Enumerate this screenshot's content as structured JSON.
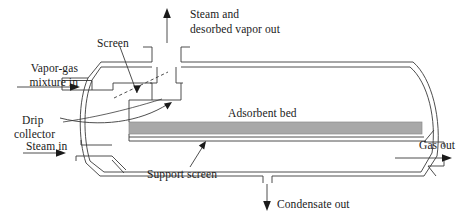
{
  "figure": {
    "type": "process-flow-diagram",
    "canvas": {
      "width": 468,
      "height": 222
    },
    "colors": {
      "line": "#3a3a3a",
      "bed_fill": "#a8a8a8",
      "bed_edge": "#8c8c8c",
      "text": "#1a1a1a",
      "background": "#ffffff"
    }
  },
  "labels": {
    "steam_out": "Steam and\ndesorbed vapor out",
    "steam_out_line1": "Steam and",
    "steam_out_line2": "desorbed vapor out",
    "screen": "Screen",
    "vapor_in_line1": "Vapor-gas",
    "vapor_in_line2": "mixture in",
    "drip_line1": "Drip",
    "drip_line2": "collector",
    "steam_in": "Steam in",
    "adsorbent_bed": "Adsorbent bed",
    "support_screen": "Support screen",
    "condensate_out": "Condensate out",
    "gas_out": "Gas out"
  },
  "flows": [
    {
      "name": "vapor-gas-mixture-in",
      "label": "Vapor-gas mixture in",
      "direction": "right",
      "location": "left-upper"
    },
    {
      "name": "steam-in",
      "label": "Steam in",
      "direction": "right",
      "location": "left-lower"
    },
    {
      "name": "steam-and-desorbed-vapor-out",
      "label": "Steam and desorbed vapor out",
      "direction": "up",
      "location": "top-center"
    },
    {
      "name": "gas-out",
      "label": "Gas out",
      "direction": "right",
      "location": "right-lower"
    },
    {
      "name": "condensate-out",
      "label": "Condensate out",
      "direction": "down",
      "location": "bottom-center"
    }
  ],
  "components": [
    {
      "name": "adsorbent-bed",
      "label": "Adsorbent bed"
    },
    {
      "name": "support-screen",
      "label": "Support screen"
    },
    {
      "name": "screen",
      "label": "Screen"
    },
    {
      "name": "drip-collector",
      "label": "Drip collector"
    }
  ]
}
